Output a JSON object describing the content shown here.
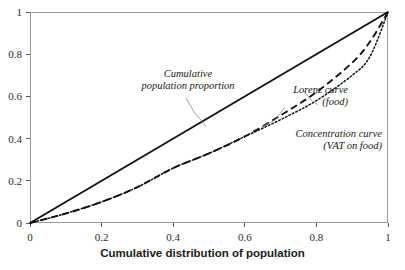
{
  "chart_data": {
    "type": "line",
    "title": "",
    "xlabel": "Cumulative distribution of population",
    "ylabel": "",
    "xlim": [
      0,
      1
    ],
    "ylim": [
      0,
      1
    ],
    "grid": false,
    "legend_position": "inline-annotations",
    "xticks": [
      "0",
      "0.2",
      "0.4",
      "0.6",
      "0.8",
      "1"
    ],
    "yticks": [
      "0",
      "0.2",
      "0.4",
      "0.6",
      "0.8",
      "1"
    ],
    "xtick_values": [
      0,
      0.2,
      0.4,
      0.6,
      0.8,
      1
    ],
    "ytick_values": [
      0,
      0.2,
      0.4,
      0.6,
      0.8,
      1
    ],
    "x": [
      0,
      0.1,
      0.2,
      0.3,
      0.4,
      0.5,
      0.6,
      0.7,
      0.8,
      0.9,
      0.95,
      1
    ],
    "series": [
      {
        "name": "Cumulative population proportion",
        "style": "solid",
        "color": "#111111",
        "values": [
          0,
          0.1,
          0.2,
          0.3,
          0.4,
          0.5,
          0.6,
          0.7,
          0.8,
          0.9,
          0.95,
          1
        ]
      },
      {
        "name": "Lorenz curve (food)",
        "style": "dashed",
        "color": "#111111",
        "values": [
          0,
          0.045,
          0.1,
          0.17,
          0.26,
          0.33,
          0.41,
          0.51,
          0.62,
          0.76,
          0.86,
          1
        ]
      },
      {
        "name": "Concentration curve (VAT on food)",
        "style": "dotted",
        "color": "#111111",
        "values": [
          0,
          0.045,
          0.1,
          0.17,
          0.26,
          0.33,
          0.41,
          0.49,
          0.58,
          0.7,
          0.79,
          1
        ]
      }
    ],
    "annotations": [
      {
        "id": "equality",
        "line1": "Cumulative",
        "line2": "population proportion",
        "align": "center"
      },
      {
        "id": "lorenz",
        "line1": "Lorenz curve",
        "line2": "(food)",
        "align": "right"
      },
      {
        "id": "concentration",
        "line1": "Concentration curve",
        "line2": "(VAT on food)",
        "align": "right"
      }
    ]
  },
  "axis": {
    "title": "Cumulative distribution of population"
  },
  "colors": {
    "frame": "#9a9a9a",
    "curve": "#111111",
    "leader": "#8a8a8a",
    "text": "#1a1a1a",
    "background": "#ffffff"
  }
}
